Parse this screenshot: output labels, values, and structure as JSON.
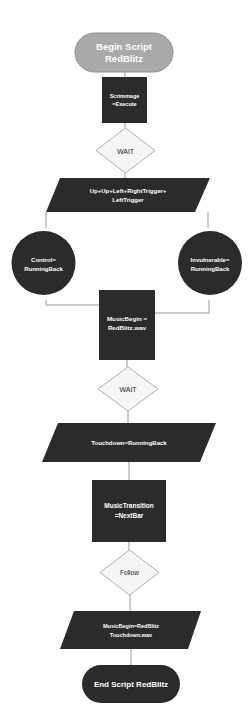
{
  "diagram": {
    "type": "flowchart",
    "colors": {
      "background": "#ffffff",
      "start_terminal": "#a9a9a9",
      "dark_node": "#2b2b2b",
      "decision": "#f5f5f5",
      "connector": "#9a9a9a"
    },
    "nodes": {
      "begin": {
        "shape": "terminal",
        "line1": "Begin Script",
        "line2": "RedBlitz"
      },
      "scrimmage": {
        "shape": "process",
        "line1": "Scrimmage",
        "line2": "=Execute"
      },
      "wait1": {
        "shape": "decision",
        "label": "WAIT"
      },
      "input_combo": {
        "shape": "data",
        "line1": "Up+Up+Left+RightTrigger+",
        "line2": "LeftTrigger"
      },
      "control": {
        "shape": "circle",
        "line1": "Control=",
        "line2": "RunningBack"
      },
      "invulnerable": {
        "shape": "circle",
        "line1": "Invulnerable=",
        "line2": "RunningBack"
      },
      "music_begin": {
        "shape": "process",
        "line1": "MusicBegin =",
        "line2": "RedBlitz.wav"
      },
      "wait2": {
        "shape": "decision",
        "label": "WAIT"
      },
      "touchdown": {
        "shape": "data",
        "label": "Touchdown=RunningBack"
      },
      "music_transition": {
        "shape": "process",
        "line1": "MusicTransition",
        "line2": "=NextBar"
      },
      "follow": {
        "shape": "decision",
        "label": "Follow"
      },
      "music_touchdown": {
        "shape": "data",
        "line1": "MusicBegin=RedBlitz",
        "line2": "Touchdown.wav"
      },
      "end": {
        "shape": "terminal",
        "label": "End Script RedBlitz"
      }
    }
  }
}
